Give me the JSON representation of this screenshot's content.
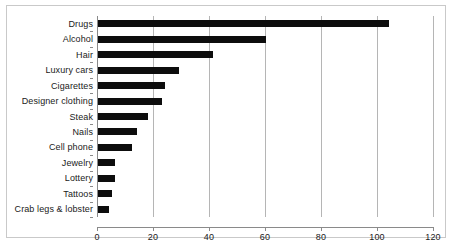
{
  "chart_data": {
    "type": "bar",
    "orientation": "horizontal",
    "title": "",
    "xlabel": "",
    "ylabel": "",
    "xlim": [
      0,
      120
    ],
    "xticks": [
      0,
      20,
      40,
      60,
      80,
      100,
      120
    ],
    "grid": true,
    "legend": false,
    "bar_color": "#0d0d0d",
    "categories": [
      "Drugs",
      "Alcohol",
      "Hair",
      "Luxury cars",
      "Cigarettes",
      "Designer clothing",
      "Steak",
      "Nails",
      "Cell phone",
      "Jewelry",
      "Lottery",
      "Tattoos",
      "Crab legs & lobster"
    ],
    "values": [
      104,
      60,
      41,
      29,
      24,
      23,
      18,
      14,
      12,
      6,
      6,
      5,
      4
    ]
  },
  "frame": {
    "border_color": "#c9c9c9",
    "axis_color": "#8a8a8a",
    "gridline_color": "#b5b5b5"
  }
}
